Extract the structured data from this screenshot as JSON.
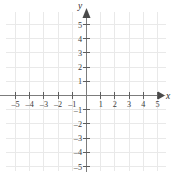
{
  "figure": {
    "kind": "cartesian-coordinate-grid",
    "background_color": "#ffffff",
    "grid_color": "#e9e9e9",
    "axis_color": "#7c7c7c",
    "tick_color": "#5e5e5e",
    "label_color": "#3b3b3b"
  },
  "axes": {
    "x": {
      "name": "x",
      "min": -6,
      "max": 6,
      "tick_labels": [
        "–5",
        "–4",
        "–3",
        "–2",
        "–1",
        "1",
        "2",
        "3",
        "4",
        "5"
      ],
      "tick_values": [
        -5,
        -4,
        -3,
        -2,
        -1,
        1,
        2,
        3,
        4,
        5
      ],
      "arrow": "right"
    },
    "y": {
      "name": "y",
      "min": -6,
      "max": 6,
      "tick_labels": [
        "5",
        "4",
        "3",
        "2",
        "1",
        "–1",
        "–2",
        "–3",
        "–4",
        "–5"
      ],
      "tick_values": [
        5,
        4,
        3,
        2,
        1,
        -1,
        -2,
        -3,
        -4,
        -5
      ],
      "arrow": "up"
    }
  },
  "origin": {
    "label": "",
    "x": 0,
    "y": 0
  },
  "series": []
}
